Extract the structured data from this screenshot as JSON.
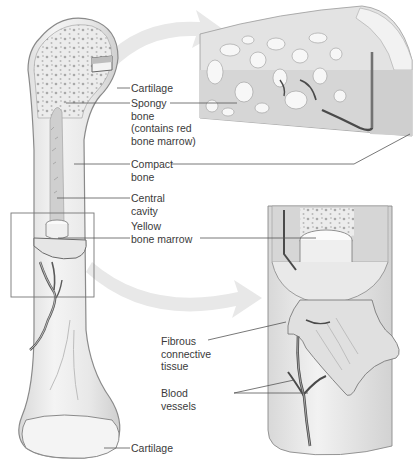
{
  "figure": {
    "colors": {
      "bone": "#eeeeee",
      "bone_outline": "#8a8a8a",
      "spongy": "#d2d2d2",
      "marrow": "#f6f6f6",
      "vessel": "#6a6a6a",
      "arrow": "#e6e6e6",
      "leader_line": "#555555",
      "text": "#3a3a3a"
    }
  },
  "labels": {
    "cartilage_top": "Cartilage",
    "spongy_bone": [
      "Spongy",
      "bone",
      "(contains red",
      "bone marrow)"
    ],
    "compact_bone": [
      "Compact",
      "bone"
    ],
    "central_cavity": [
      "Central",
      "cavity"
    ],
    "yellow_marrow": [
      "Yellow",
      "bone marrow"
    ],
    "fibrous_tissue": [
      "Fibrous",
      "connective",
      "tissue"
    ],
    "blood_vessels": [
      "Blood",
      "vessels"
    ],
    "cartilage_bottom": "Cartilage"
  },
  "panels": {
    "main_bone": "Whole long bone, longitudinal section",
    "top_inset": "Enlarged spongy and compact bone at proximal end",
    "bottom_inset": "Enlarged shaft section with marrow, membrane and vessels"
  }
}
